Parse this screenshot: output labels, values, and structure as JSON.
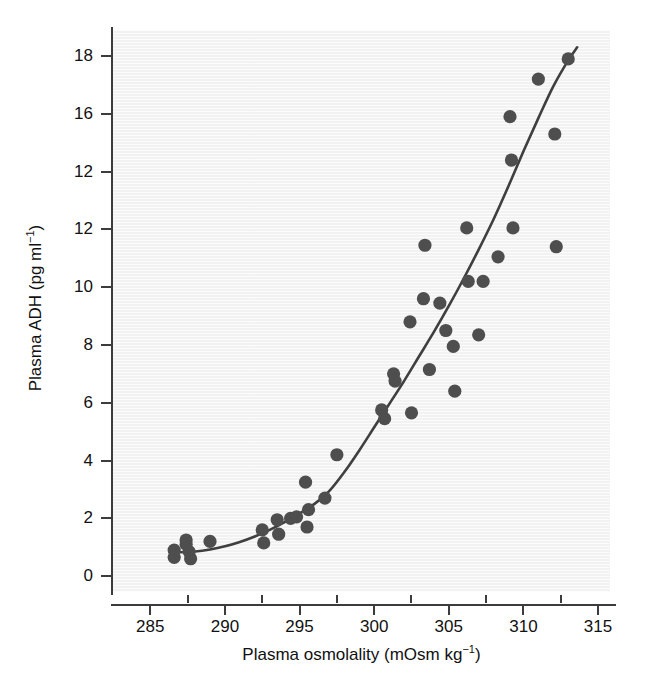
{
  "chart_data": {
    "type": "scatter",
    "title": "",
    "xlabel": "Plasma osmolality (mOsm kg−1)",
    "ylabel": "Plasma ADH (pg ml−1)",
    "xlabel_parts": {
      "text": "Plasma osmolality (mOsm kg",
      "sup": "−1",
      "tail": ")"
    },
    "ylabel_parts": {
      "text": "Plasma ADH (pg ml",
      "sup": "−1",
      "tail": ")"
    },
    "xlim": [
      282.5,
      315.8
    ],
    "ylim": [
      -0.55,
      18.9
    ],
    "grid": false,
    "legend": null,
    "marker_color": "#4e4e4e",
    "line_color": "#3f3f3f",
    "plot_background": "#f2f2f2",
    "xticks": [
      285,
      290,
      295,
      300,
      305,
      310,
      315
    ],
    "xtick_labels": [
      "285",
      "290",
      "295",
      "300",
      "305",
      "310",
      "315"
    ],
    "xticks_minor": [
      287.5,
      292.5,
      297.5,
      302.5,
      307.5,
      312.5
    ],
    "yticks": [
      0,
      2,
      4,
      6,
      8,
      10,
      12,
      14,
      16,
      18
    ],
    "ytick_labels": [
      "0",
      "2",
      "4",
      "6",
      "8",
      "10",
      "12",
      "12",
      "16",
      "18"
    ],
    "series": [
      {
        "name": "observations",
        "points": [
          [
            286.6,
            0.9
          ],
          [
            286.6,
            0.65
          ],
          [
            287.4,
            1.25
          ],
          [
            287.4,
            1.1
          ],
          [
            287.6,
            0.85
          ],
          [
            287.7,
            0.6
          ],
          [
            289.0,
            1.2
          ],
          [
            292.5,
            1.6
          ],
          [
            292.6,
            1.15
          ],
          [
            293.5,
            1.95
          ],
          [
            293.6,
            1.45
          ],
          [
            294.4,
            2.0
          ],
          [
            294.8,
            2.05
          ],
          [
            295.4,
            3.25
          ],
          [
            295.5,
            1.7
          ],
          [
            295.6,
            2.3
          ],
          [
            296.7,
            2.7
          ],
          [
            297.5,
            4.2
          ],
          [
            300.5,
            5.75
          ],
          [
            300.7,
            5.45
          ],
          [
            301.3,
            7.0
          ],
          [
            301.4,
            6.75
          ],
          [
            302.4,
            8.8
          ],
          [
            302.5,
            5.65
          ],
          [
            303.3,
            9.6
          ],
          [
            303.4,
            11.45
          ],
          [
            303.7,
            7.15
          ],
          [
            304.4,
            9.45
          ],
          [
            304.8,
            8.5
          ],
          [
            305.3,
            7.95
          ],
          [
            305.4,
            6.4
          ],
          [
            306.2,
            12.05
          ],
          [
            306.3,
            10.2
          ],
          [
            307.0,
            8.35
          ],
          [
            307.3,
            10.2
          ],
          [
            308.3,
            11.05
          ],
          [
            309.1,
            15.9
          ],
          [
            309.2,
            14.4
          ],
          [
            309.3,
            12.05
          ],
          [
            311.0,
            17.2
          ],
          [
            312.1,
            15.3
          ],
          [
            312.2,
            11.4
          ],
          [
            313.0,
            17.9
          ]
        ]
      }
    ],
    "fit_curve": {
      "name": "fitted regression curve",
      "points": [
        [
          286.8,
          0.82
        ],
        [
          288.0,
          0.85
        ],
        [
          289.0,
          0.92
        ],
        [
          290.0,
          1.03
        ],
        [
          291.0,
          1.18
        ],
        [
          292.0,
          1.37
        ],
        [
          293.0,
          1.6
        ],
        [
          294.0,
          1.87
        ],
        [
          295.0,
          2.17
        ],
        [
          296.0,
          2.5
        ],
        [
          297.0,
          2.95
        ],
        [
          298.0,
          3.6
        ],
        [
          299.0,
          4.35
        ],
        [
          300.0,
          5.15
        ],
        [
          301.0,
          5.95
        ],
        [
          302.0,
          6.75
        ],
        [
          303.0,
          7.6
        ],
        [
          304.0,
          8.45
        ],
        [
          305.0,
          9.35
        ],
        [
          306.0,
          10.3
        ],
        [
          307.0,
          11.3
        ],
        [
          308.0,
          12.35
        ],
        [
          309.0,
          13.5
        ],
        [
          310.0,
          14.7
        ],
        [
          311.0,
          15.85
        ],
        [
          312.0,
          16.95
        ],
        [
          313.0,
          17.85
        ],
        [
          313.6,
          18.3
        ]
      ]
    }
  }
}
